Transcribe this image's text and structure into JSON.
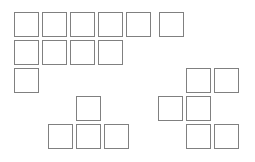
{
  "diagram": {
    "background_color": "#ffffff",
    "square_color": "#ffffff",
    "border_color": "#808080",
    "border_width_px": 1,
    "canvas": {
      "width": 255,
      "height": 162
    },
    "geometry": {
      "cell_size": 25,
      "col_pitch": 28,
      "row_pitch": 28,
      "origin_x": 14,
      "origin_y": 12
    },
    "total_squares": 20,
    "groups": [
      {
        "name": "top-left-block",
        "label": "Top left block",
        "count": 11,
        "squares": [
          {
            "id": "r1c1",
            "row": 1,
            "col": 1,
            "x": 14,
            "y": 12
          },
          {
            "id": "r1c2",
            "row": 1,
            "col": 2,
            "x": 42,
            "y": 12
          },
          {
            "id": "r1c3",
            "row": 1,
            "col": 3,
            "x": 70,
            "y": 12
          },
          {
            "id": "r1c4",
            "row": 1,
            "col": 4,
            "x": 98,
            "y": 12
          },
          {
            "id": "r1c5",
            "row": 1,
            "col": 5,
            "x": 126,
            "y": 12
          },
          {
            "id": "r1c6",
            "row": 1,
            "col": 6,
            "x": 159,
            "y": 12
          },
          {
            "id": "r2c1",
            "row": 2,
            "col": 1,
            "x": 14,
            "y": 40
          },
          {
            "id": "r2c2",
            "row": 2,
            "col": 2,
            "x": 42,
            "y": 40
          },
          {
            "id": "r2c3",
            "row": 2,
            "col": 3,
            "x": 70,
            "y": 40
          },
          {
            "id": "r2c4",
            "row": 2,
            "col": 4,
            "x": 98,
            "y": 40
          },
          {
            "id": "r3c1",
            "row": 3,
            "col": 1,
            "x": 14,
            "y": 68
          }
        ]
      },
      {
        "name": "bottom-center-block",
        "label": "Bottom center T shape",
        "count": 4,
        "squares": [
          {
            "id": "m-top",
            "row": 4,
            "col": 3,
            "x": 76,
            "y": 96
          },
          {
            "id": "m-bl",
            "row": 5,
            "col": 2,
            "x": 48,
            "y": 124
          },
          {
            "id": "m-bc",
            "row": 5,
            "col": 3,
            "x": 76,
            "y": 124
          },
          {
            "id": "m-br",
            "row": 5,
            "col": 4,
            "x": 104,
            "y": 124
          }
        ]
      },
      {
        "name": "right-block",
        "label": "Right staircase block",
        "count": 6,
        "squares": [
          {
            "id": "r-t1",
            "row": 3,
            "col": 7,
            "x": 186,
            "y": 68
          },
          {
            "id": "r-t2",
            "row": 3,
            "col": 8,
            "x": 214,
            "y": 68
          },
          {
            "id": "r-m1",
            "row": 4,
            "col": 6,
            "x": 158,
            "y": 96
          },
          {
            "id": "r-m2",
            "row": 4,
            "col": 7,
            "x": 186,
            "y": 96
          },
          {
            "id": "r-b1",
            "row": 5,
            "col": 7,
            "x": 186,
            "y": 124
          },
          {
            "id": "r-b2",
            "row": 5,
            "col": 8,
            "x": 214,
            "y": 124
          }
        ]
      }
    ]
  }
}
